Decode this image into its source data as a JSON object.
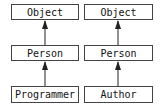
{
  "diagram": {
    "type": "class-inheritance",
    "columns": [
      {
        "nodes": [
          {
            "label": "Object"
          },
          {
            "label": "Person"
          },
          {
            "label": "Programmer"
          }
        ]
      },
      {
        "nodes": [
          {
            "label": "Object"
          },
          {
            "label": "Person"
          },
          {
            "label": "Author"
          }
        ]
      }
    ],
    "edges": [
      {
        "from": "Person",
        "to": "Object",
        "column": 0
      },
      {
        "from": "Programmer",
        "to": "Person",
        "column": 0
      },
      {
        "from": "Person",
        "to": "Object",
        "column": 1
      },
      {
        "from": "Author",
        "to": "Person",
        "column": 1
      }
    ],
    "colors": {
      "border": "#444444",
      "text": "#111111",
      "arrow": "#222222",
      "background": "#ffffff"
    }
  }
}
